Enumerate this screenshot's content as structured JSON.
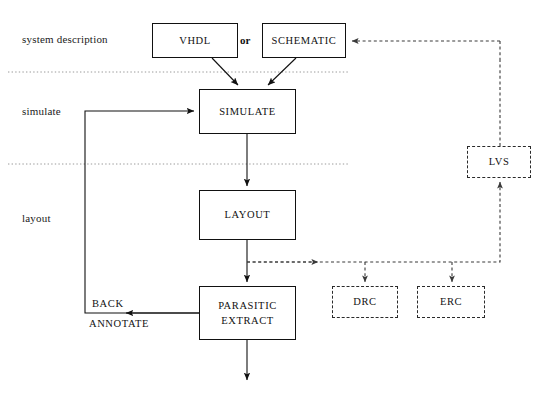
{
  "diagram": {
    "background_color": "#ffffff",
    "line_color": "#111111",
    "dashed_line_color": "#3a3a3a",
    "divider_color": "#9a9a9a"
  },
  "stage_labels": [
    {
      "id": "system-description",
      "text": "system description",
      "x": 22,
      "y": 33
    },
    {
      "id": "simulate",
      "text": "simulate",
      "x": 22,
      "y": 105
    },
    {
      "id": "layout",
      "text": "layout",
      "x": 22,
      "y": 212
    }
  ],
  "boxes": [
    {
      "id": "vhdl",
      "lines": [
        "VHDL"
      ],
      "style": "solid",
      "x": 152,
      "y": 23,
      "w": 86,
      "h": 35
    },
    {
      "id": "schematic",
      "lines": [
        "SCHEMATIC"
      ],
      "style": "solid",
      "x": 262,
      "y": 23,
      "w": 84,
      "h": 35
    },
    {
      "id": "simulate",
      "lines": [
        "SIMULATE"
      ],
      "style": "solid",
      "x": 199,
      "y": 89,
      "w": 97,
      "h": 45
    },
    {
      "id": "layout",
      "lines": [
        "LAYOUT"
      ],
      "style": "solid",
      "x": 199,
      "y": 190,
      "w": 97,
      "h": 50
    },
    {
      "id": "parasitic-extract",
      "lines": [
        "PARASITIC",
        "EXTRACT"
      ],
      "style": "solid",
      "x": 199,
      "y": 286,
      "w": 97,
      "h": 54
    },
    {
      "id": "lvs",
      "lines": [
        "LVS"
      ],
      "style": "dashed",
      "x": 467,
      "y": 146,
      "w": 64,
      "h": 32
    },
    {
      "id": "drc",
      "lines": [
        "DRC"
      ],
      "style": "dashed",
      "x": 332,
      "y": 286,
      "w": 66,
      "h": 32
    },
    {
      "id": "erc",
      "lines": [
        "ERC"
      ],
      "style": "dashed",
      "x": 417,
      "y": 286,
      "w": 68,
      "h": 32
    }
  ],
  "connector_labels": [
    {
      "id": "or",
      "text": "or",
      "x": 240,
      "y": 35,
      "bold": true
    },
    {
      "id": "back",
      "text": "BACK",
      "x": 92,
      "y": 298
    },
    {
      "id": "annotate",
      "text": "ANNOTATE",
      "x": 89,
      "y": 318
    }
  ],
  "dividers": [
    {
      "id": "divider-system-simulate",
      "y": 72,
      "x1": 8,
      "x2": 348
    },
    {
      "id": "divider-simulate-layout",
      "y": 164,
      "x1": 8,
      "x2": 348
    }
  ],
  "flows": [
    {
      "id": "vhdl-to-simulate",
      "from": "vhdl",
      "to": "simulate",
      "style": "solid"
    },
    {
      "id": "schematic-to-simulate",
      "from": "schematic",
      "to": "simulate",
      "style": "solid"
    },
    {
      "id": "simulate-to-layout",
      "from": "simulate",
      "to": "layout",
      "style": "solid"
    },
    {
      "id": "layout-to-parasitic-extract",
      "from": "layout",
      "to": "parasitic-extract",
      "style": "solid"
    },
    {
      "id": "parasitic-extract-to-output",
      "from": "parasitic-extract",
      "to": "output",
      "style": "solid"
    },
    {
      "id": "back-annotate-feedback",
      "from": "parasitic-extract",
      "to": "simulate",
      "style": "solid"
    },
    {
      "id": "layout-to-drc",
      "from": "layout",
      "to": "drc",
      "style": "dashed"
    },
    {
      "id": "layout-to-erc",
      "from": "layout",
      "to": "erc",
      "style": "dashed"
    },
    {
      "id": "layout-to-lvs",
      "from": "layout",
      "to": "lvs",
      "style": "dashed"
    },
    {
      "id": "lvs-to-schematic",
      "from": "lvs",
      "to": "schematic",
      "style": "dashed"
    }
  ]
}
